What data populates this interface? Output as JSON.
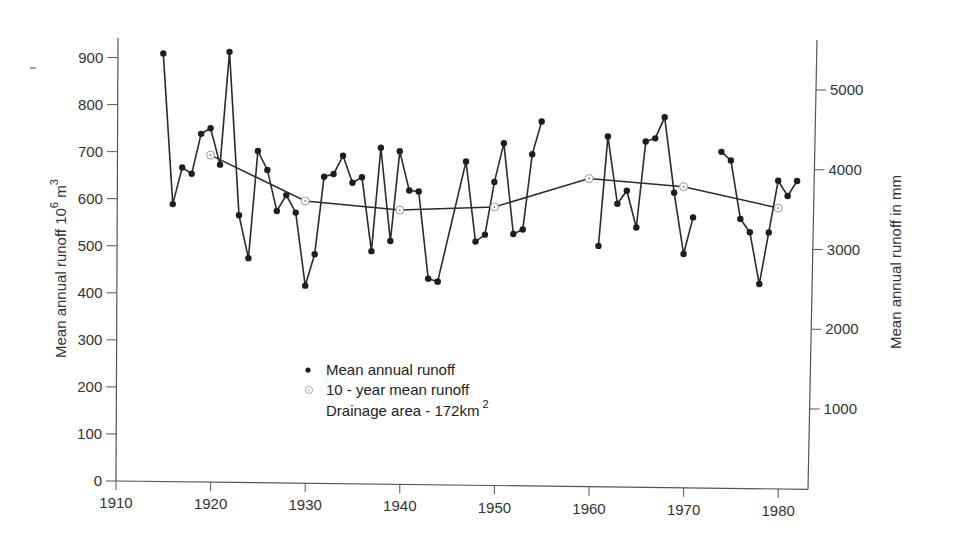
{
  "chart_data": {
    "type": "line",
    "title": "",
    "xlabel": "",
    "ylabel": "Mean annual runoff 10^6 m^3",
    "ylabel_parts": {
      "text": "Mean annual runoff 10",
      "sup1": "6",
      "mid": " m",
      "sup2": "3"
    },
    "ylabel_right": "Mean annual runoff in mm",
    "xlim": [
      1910,
      1983
    ],
    "ylim": [
      0,
      950
    ],
    "ylim_right": [
      0,
      5800
    ],
    "x_ticks": [
      1910,
      1920,
      1930,
      1940,
      1950,
      1960,
      1970,
      1980
    ],
    "y_ticks": [
      0,
      100,
      200,
      300,
      400,
      500,
      600,
      700,
      800,
      900
    ],
    "y_ticks_right": [
      1000,
      2000,
      3000,
      4000,
      5000
    ],
    "grid": false,
    "legend_position": "lower-center-left",
    "legend": [
      {
        "label": "Mean annual runoff",
        "marker": "filled-dot"
      },
      {
        "label": "10 - year mean runoff",
        "marker": "open-circle-dot"
      }
    ],
    "annotation": {
      "text": "Drainage area - 172km",
      "sup": "2"
    },
    "series": [
      {
        "name": "Mean annual runoff",
        "marker": "filled-dot",
        "segments": [
          {
            "x": [
              1915,
              1916,
              1917,
              1918,
              1919,
              1920,
              1921,
              1922,
              1923,
              1924,
              1925,
              1926,
              1927,
              1928,
              1929,
              1930,
              1931,
              1932,
              1933,
              1934,
              1935,
              1936,
              1937,
              1938,
              1939,
              1940,
              1941,
              1942,
              1943,
              1944
            ],
            "values": [
              910,
              590,
              668,
              655,
              740,
              752,
              675,
              915,
              568,
              477,
              705,
              665,
              578,
              612,
              575,
              420,
              487,
              652,
              658,
              697,
              640,
              652,
              495,
              715,
              517,
              708,
              625,
              623,
              438,
              432
            ]
          },
          {
            "x": [
              1944,
              1947,
              1948,
              1949,
              1950,
              1951,
              1952,
              1953,
              1954,
              1955
            ],
            "values": [
              432,
              688,
              518,
              533,
              645,
              728,
              535,
              545,
              705,
              775
            ]
          },
          {
            "x": [
              1961,
              1962,
              1963,
              1964,
              1965,
              1966,
              1967,
              1968,
              1969,
              1970,
              1971
            ],
            "values": [
              512,
              745,
              602,
              630,
              552,
              735,
              742,
              787,
              627,
              497,
              575
            ]
          },
          {
            "x": [
              1974,
              1975,
              1976,
              1977,
              1978,
              1979,
              1980,
              1981,
              1982
            ],
            "values": [
              715,
              697,
              573,
              545,
              435,
              545,
              655,
              623,
              655
            ]
          }
        ]
      },
      {
        "name": "10 - year mean runoff",
        "marker": "open-circle-dot",
        "x": [
          1920,
          1930,
          1940,
          1950,
          1960,
          1970,
          1980
        ],
        "values": [
          695,
          600,
          583,
          592,
          655,
          640,
          597
        ]
      }
    ]
  }
}
